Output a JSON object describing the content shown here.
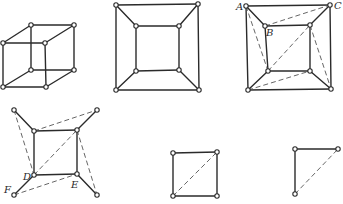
{
  "figures": [
    {
      "id": "cube",
      "nodes": [
        [
          31,
          25
        ],
        [
          74,
          25
        ],
        [
          31,
          70
        ],
        [
          74,
          70
        ],
        [
          3,
          43
        ],
        [
          45,
          43
        ],
        [
          3,
          87
        ],
        [
          46,
          87
        ]
      ],
      "edges": [
        [
          0,
          1
        ],
        [
          0,
          2
        ],
        [
          1,
          3
        ],
        [
          2,
          3
        ],
        [
          4,
          5
        ],
        [
          4,
          6
        ],
        [
          5,
          7
        ],
        [
          6,
          7
        ],
        [
          0,
          4
        ],
        [
          1,
          5
        ],
        [
          2,
          6
        ],
        [
          3,
          7
        ]
      ],
      "dashed": [],
      "labels": []
    },
    {
      "id": "planar-cube",
      "nodes": [
        [
          116,
          5
        ],
        [
          198,
          4
        ],
        [
          116,
          90
        ],
        [
          199,
          90
        ],
        [
          136,
          26
        ],
        [
          179,
          26
        ],
        [
          136,
          71
        ],
        [
          179,
          70
        ]
      ],
      "edges": [
        [
          0,
          1
        ],
        [
          0,
          2
        ],
        [
          1,
          3
        ],
        [
          2,
          3
        ],
        [
          4,
          5
        ],
        [
          4,
          6
        ],
        [
          5,
          7
        ],
        [
          6,
          7
        ],
        [
          0,
          4
        ],
        [
          1,
          5
        ],
        [
          2,
          6
        ],
        [
          3,
          7
        ]
      ],
      "dashed": [],
      "labels": []
    },
    {
      "id": "planar-cube-triangulated",
      "nodes": [
        [
          246,
          6
        ],
        [
          330,
          5
        ],
        [
          248,
          90
        ],
        [
          331,
          89
        ],
        [
          265,
          26
        ],
        [
          310,
          25
        ],
        [
          268,
          71
        ],
        [
          310,
          71
        ]
      ],
      "edges": [
        [
          0,
          1
        ],
        [
          0,
          2
        ],
        [
          1,
          3
        ],
        [
          2,
          3
        ],
        [
          4,
          5
        ],
        [
          4,
          6
        ],
        [
          5,
          7
        ],
        [
          6,
          7
        ],
        [
          0,
          4
        ],
        [
          1,
          5
        ],
        [
          2,
          6
        ],
        [
          3,
          7
        ]
      ],
      "dashed": [
        [
          4,
          1
        ],
        [
          0,
          6
        ],
        [
          6,
          5
        ],
        [
          2,
          7
        ],
        [
          5,
          3
        ]
      ],
      "labels": [
        {
          "text": "A",
          "x": 236,
          "y": 10
        },
        {
          "text": "C",
          "x": 334,
          "y": 9
        },
        {
          "text": "B",
          "x": 266,
          "y": 36
        }
      ]
    },
    {
      "id": "outer-removed",
      "nodes": [
        [
          14,
          110
        ],
        [
          97,
          110
        ],
        [
          14,
          195
        ],
        [
          97,
          195
        ],
        [
          34,
          131
        ],
        [
          77,
          130
        ],
        [
          34,
          175
        ],
        [
          77,
          174
        ]
      ],
      "edges": [
        [
          4,
          5
        ],
        [
          4,
          6
        ],
        [
          5,
          7
        ],
        [
          6,
          7
        ],
        [
          0,
          4
        ],
        [
          1,
          5
        ],
        [
          2,
          6
        ],
        [
          3,
          7
        ]
      ],
      "dashed": [
        [
          4,
          1
        ],
        [
          0,
          6
        ],
        [
          6,
          5
        ],
        [
          2,
          7
        ],
        [
          5,
          3
        ]
      ],
      "labels": [
        {
          "text": "D",
          "x": 23,
          "y": 180
        },
        {
          "text": "E",
          "x": 71,
          "y": 188
        },
        {
          "text": "F",
          "x": 4,
          "y": 193
        }
      ]
    },
    {
      "id": "square-with-diagonal",
      "nodes": [
        [
          173,
          153
        ],
        [
          217,
          152
        ],
        [
          173,
          196
        ],
        [
          217,
          196
        ]
      ],
      "edges": [
        [
          0,
          1
        ],
        [
          0,
          2
        ],
        [
          1,
          3
        ],
        [
          2,
          3
        ]
      ],
      "dashed": [
        [
          2,
          1
        ]
      ],
      "labels": []
    },
    {
      "id": "triangle",
      "nodes": [
        [
          295,
          149
        ],
        [
          338,
          149
        ],
        [
          295,
          194
        ]
      ],
      "edges": [
        [
          0,
          1
        ],
        [
          0,
          2
        ]
      ],
      "dashed": [
        [
          2,
          1
        ]
      ],
      "labels": []
    }
  ],
  "style": {
    "edge_color": "#2b2b2b",
    "dash_color": "#555555",
    "background": "#ffffff"
  }
}
